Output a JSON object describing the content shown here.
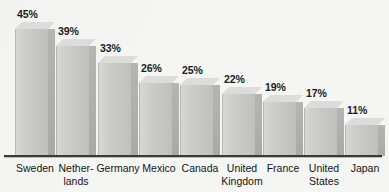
{
  "chart_data": {
    "type": "bar",
    "title": "",
    "subtitle": "",
    "xlabel": "",
    "ylabel": "",
    "ylim": [
      0,
      45
    ],
    "grid": false,
    "legend": false,
    "value_suffix": "%",
    "style": "3d-extruded-bar",
    "orientation": "vertical",
    "sorted": "descending",
    "categories": [
      "Sweden",
      "Netherlands",
      "Germany",
      "Mexico",
      "Canada",
      "United Kingdom",
      "France",
      "United States",
      "Japan"
    ],
    "values": [
      45,
      39,
      33,
      26,
      25,
      22,
      19,
      17,
      11
    ],
    "data_labels": [
      "45%",
      "39%",
      "33%",
      "26%",
      "25%",
      "22%",
      "19%",
      "17%",
      "11%"
    ],
    "category_label_lines": [
      [
        "Sweden"
      ],
      [
        "Nether-",
        "lands"
      ],
      [
        "Germany"
      ],
      [
        "Mexico"
      ],
      [
        "Canada"
      ],
      [
        "United",
        "Kingdom"
      ],
      [
        "France"
      ],
      [
        "United",
        "States"
      ],
      [
        "Japan"
      ]
    ]
  },
  "colors": {
    "background": "#f5f5f4",
    "bar_front": "#cdcdcb",
    "bar_side": "#aeaeac",
    "bar_top": "#dcdcda",
    "axis_line": "#3a3a3a",
    "text": "#141414"
  }
}
